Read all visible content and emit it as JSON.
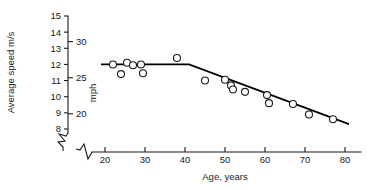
{
  "chart_data": {
    "type": "scatter",
    "title": "",
    "xlabel": "Age, years",
    "ylabel": "Average speed m/s",
    "y2label": "mph",
    "xlim": [
      16,
      84
    ],
    "ylim": [
      7.3,
      15.2
    ],
    "y2lim": [
      16.3,
      34.0
    ],
    "grid": false,
    "legend": null,
    "xticks": [
      20,
      30,
      40,
      50,
      60,
      70,
      80
    ],
    "xtick_labels": [
      "20",
      "30",
      "40",
      "50",
      "60",
      "70",
      "80"
    ],
    "yticks": [
      8,
      9,
      10,
      11,
      12,
      13,
      14,
      15
    ],
    "ytick_labels": [
      "8",
      "9",
      "10",
      "11",
      "12",
      "13",
      "14",
      "15"
    ],
    "y2ticks": [
      20,
      25,
      30
    ],
    "y2tick_labels": [
      "20",
      "25",
      "30"
    ],
    "axis_break_x": true,
    "axis_break_y": true,
    "marker": "open-circle",
    "x": [
      22,
      24,
      25.5,
      27,
      29,
      29.5,
      38,
      45,
      50,
      51.5,
      52,
      55,
      60.5,
      61,
      67,
      71,
      77
    ],
    "y": [
      12.0,
      11.4,
      12.1,
      11.95,
      12.0,
      11.45,
      12.4,
      11.0,
      11.05,
      10.7,
      10.45,
      10.3,
      10.1,
      9.6,
      9.55,
      8.9,
      8.6
    ],
    "points": [
      {
        "age": 22,
        "speed_ms": 12.0
      },
      {
        "age": 24,
        "speed_ms": 11.4
      },
      {
        "age": 25.5,
        "speed_ms": 12.1
      },
      {
        "age": 27,
        "speed_ms": 11.95
      },
      {
        "age": 29,
        "speed_ms": 12.0
      },
      {
        "age": 29.5,
        "speed_ms": 11.45
      },
      {
        "age": 38,
        "speed_ms": 12.4
      },
      {
        "age": 45,
        "speed_ms": 11.0
      },
      {
        "age": 50,
        "speed_ms": 11.05
      },
      {
        "age": 51.5,
        "speed_ms": 10.7
      },
      {
        "age": 52,
        "speed_ms": 10.45
      },
      {
        "age": 55,
        "speed_ms": 10.3
      },
      {
        "age": 60.5,
        "speed_ms": 10.1
      },
      {
        "age": 61,
        "speed_ms": 9.6
      },
      {
        "age": 67,
        "speed_ms": 9.55
      },
      {
        "age": 71,
        "speed_ms": 8.9
      },
      {
        "age": 77,
        "speed_ms": 8.6
      }
    ],
    "series": [
      {
        "name": "fitted-trend",
        "type": "line",
        "segments": [
          {
            "from": {
              "age": 19,
              "speed_ms": 12.0
            },
            "to": {
              "age": 41,
              "speed_ms": 12.0
            }
          },
          {
            "from": {
              "age": 41,
              "speed_ms": 12.0
            },
            "to": {
              "age": 81,
              "speed_ms": 8.3
            }
          }
        ]
      }
    ],
    "colors": {
      "axis": "#1a1a1a",
      "marker_stroke": "#1a1a1a",
      "marker_fill": "#ffffff",
      "fit_line": "#000000",
      "background": "#ffffff"
    }
  }
}
